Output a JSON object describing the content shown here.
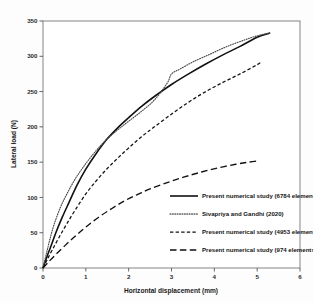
{
  "figure": {
    "background": "#fdfdfd",
    "frame_color": "#777777"
  },
  "chart_data": {
    "type": "line",
    "title": "",
    "xlabel": "Horizontal displacement (mm)",
    "ylabel": "Lateral load (N)",
    "xlim": [
      0,
      6
    ],
    "ylim": [
      0,
      350
    ],
    "xticks": [
      0,
      1,
      2,
      3,
      4,
      5,
      6
    ],
    "xtick_labels": [
      "0",
      "1",
      "2",
      "3",
      "4",
      "5",
      "6"
    ],
    "yticks": [
      0,
      50,
      100,
      150,
      200,
      250,
      300,
      350
    ],
    "ytick_labels": [
      "0",
      "50",
      "100",
      "150",
      "200",
      "250",
      "300",
      "350"
    ],
    "grid": false,
    "legend_position": "lower-right-inside",
    "series": [
      {
        "name": "Present numerical study (6784 elements)",
        "style": "solid",
        "color": "#111111",
        "x": [
          0,
          0.08,
          0.18,
          0.3,
          0.45,
          0.6,
          0.8,
          1.0,
          1.25,
          1.5,
          1.75,
          2.0,
          2.3,
          2.6,
          3.0,
          3.4,
          3.8,
          4.2,
          4.6,
          5.0,
          5.3
        ],
        "y": [
          0,
          14,
          30,
          50,
          72,
          92,
          118,
          140,
          163,
          183,
          199,
          213,
          229,
          243,
          260,
          275,
          289,
          302,
          314,
          327,
          333
        ]
      },
      {
        "name": "Sivapriya and Gandhi (2020)",
        "style": "dotted",
        "color": "#4a4a4a",
        "x": [
          0,
          0.07,
          0.15,
          0.25,
          0.4,
          0.55,
          0.75,
          1.0,
          1.25,
          1.5,
          1.75,
          2.0,
          2.3,
          2.6,
          2.9,
          3.0,
          3.2,
          3.5,
          3.9,
          4.3,
          4.7,
          5.0,
          5.3
        ],
        "y": [
          0,
          18,
          38,
          60,
          85,
          104,
          126,
          148,
          167,
          183,
          196,
          208,
          222,
          238,
          262,
          275,
          282,
          292,
          303,
          314,
          323,
          329,
          333
        ]
      },
      {
        "name": "Present numerical study (4953 elements)",
        "style": "dashed-short",
        "color": "#111111",
        "x": [
          0,
          0.1,
          0.22,
          0.38,
          0.55,
          0.75,
          1.0,
          1.25,
          1.5,
          1.75,
          2.0,
          2.3,
          2.6,
          3.0,
          3.4,
          3.8,
          4.2,
          4.6,
          5.0,
          5.1
        ],
        "y": [
          0,
          12,
          26,
          44,
          62,
          82,
          105,
          124,
          141,
          156,
          170,
          186,
          200,
          218,
          235,
          250,
          263,
          275,
          288,
          292
        ]
      },
      {
        "name": "Present numerical study (974 elements)",
        "style": "dashed-long",
        "color": "#111111",
        "x": [
          0,
          0.12,
          0.28,
          0.5,
          0.75,
          1.0,
          1.3,
          1.6,
          1.9,
          2.2,
          2.5,
          2.9,
          3.3,
          3.7,
          4.1,
          4.5,
          4.8,
          5.05
        ],
        "y": [
          0,
          8,
          18,
          31,
          45,
          58,
          72,
          84,
          95,
          104,
          112,
          121,
          129,
          136,
          142,
          147,
          150,
          152
        ]
      }
    ],
    "legend_entries": [
      {
        "label": "Present numerical study (6784 elements)",
        "style": "solid"
      },
      {
        "label": "Sivapriya and Gandhi (2020)",
        "style": "dotted"
      },
      {
        "label": "Present numerical study (4953 elements)",
        "style": "dashed-short"
      },
      {
        "label": "Present numerical study (974 elements)",
        "style": "dashed-long"
      }
    ]
  }
}
